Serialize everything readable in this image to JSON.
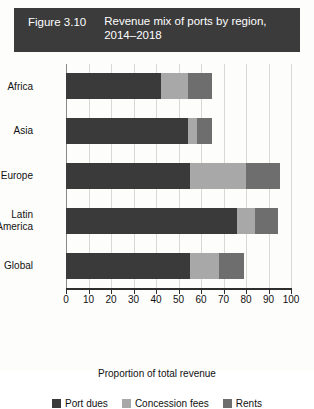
{
  "figure": {
    "number": "Figure 3.10",
    "title": "Revenue mix of ports by region, 2014–2018",
    "banner_color": "#3b3b3b"
  },
  "chart_data": {
    "type": "bar",
    "orientation": "horizontal",
    "stacked": true,
    "title": "Revenue mix of ports by region, 2014–2018",
    "xlabel": "Proportion of total revenue",
    "ylabel": "",
    "xlim": [
      0,
      100
    ],
    "xticks": [
      0,
      10,
      20,
      30,
      40,
      50,
      60,
      70,
      80,
      90,
      100
    ],
    "xtick_labels": [
      "0",
      "10",
      "20",
      "30",
      "40",
      "50",
      "60",
      "70",
      "80",
      "90",
      "100"
    ],
    "grid": "vertical",
    "legend_position": "bottom",
    "categories": [
      "Africa",
      "Asia",
      "Europe",
      "Latin America",
      "Global"
    ],
    "category_label_lines": [
      [
        "Africa"
      ],
      [
        "Asia"
      ],
      [
        "Europe"
      ],
      [
        "Latin",
        "America"
      ],
      [
        "Global"
      ]
    ],
    "series": [
      {
        "name": "Port dues",
        "color": "#3a3a3a",
        "values": [
          42,
          54,
          55,
          76,
          55
        ]
      },
      {
        "name": "Concession fees",
        "color": "#a8a8a8",
        "values": [
          12,
          4,
          25,
          8,
          13
        ]
      },
      {
        "name": "Rents",
        "color": "#6e6e6e",
        "values": [
          11,
          7,
          15,
          10,
          11
        ]
      }
    ],
    "totals": [
      65,
      65,
      95,
      94,
      79
    ]
  }
}
